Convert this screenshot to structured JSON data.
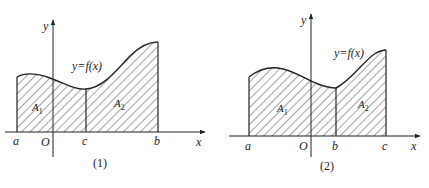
{
  "figures": [
    {
      "id": "fig1",
      "caption": "(1)",
      "curve_label": "y=f(x)",
      "axis_x_label": "x",
      "axis_y_label": "y",
      "origin_label": "O",
      "points": [
        {
          "label": "a",
          "x": 17
        },
        {
          "label": "c",
          "x": 86
        },
        {
          "label": "b",
          "x": 158
        }
      ],
      "regions": [
        {
          "label": "A",
          "sub": "1",
          "from": "a",
          "to": "c"
        },
        {
          "label": "A",
          "sub": "2",
          "from": "c",
          "to": "b"
        }
      ]
    },
    {
      "id": "fig2",
      "caption": "(2)",
      "curve_label": "y=f(x)",
      "axis_x_label": "x",
      "axis_y_label": "y",
      "origin_label": "O",
      "points": [
        {
          "label": "a",
          "x": 249
        },
        {
          "label": "b",
          "x": 336
        },
        {
          "label": "c",
          "x": 386
        }
      ],
      "regions": [
        {
          "label": "A",
          "sub": "1",
          "from": "a",
          "to": "b"
        },
        {
          "label": "A",
          "sub": "2",
          "from": "b",
          "to": "c"
        }
      ]
    }
  ],
  "colors": {
    "stroke": "#222222",
    "hatch": "#333333",
    "background": "#ffffff"
  }
}
